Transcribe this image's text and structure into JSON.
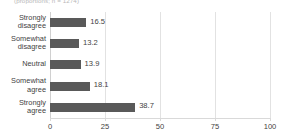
{
  "caption": "(proportions; n = 1274)",
  "colors": {
    "bar": "#595959",
    "grid": "#e2e2e2",
    "axis": "#d9d9d9",
    "text": "#3f3f3f",
    "caption": "#b8b8b8",
    "background": "#ffffff"
  },
  "chart_data": {
    "type": "bar",
    "orientation": "horizontal",
    "title": "",
    "subtitle": "(proportions; n = 1274)",
    "xlabel": "",
    "ylabel": "",
    "categories": [
      "Strongly\ndisagree",
      "Somewhat\ndisagree",
      "Neutral",
      "Somewhat\nagree",
      "Strongly\nagree"
    ],
    "values": [
      16.5,
      13.2,
      13.9,
      18.1,
      38.7
    ],
    "value_labels": [
      "16.5",
      "13.2",
      "13.9",
      "18.1",
      "38.7"
    ],
    "xlim": [
      0,
      100
    ],
    "xticks": [
      0,
      25,
      50,
      75,
      100
    ],
    "xtick_labels": [
      "0",
      "25",
      "50",
      "75",
      "100"
    ],
    "grid": true,
    "grid_axis": "x",
    "legend": false,
    "series": [
      {
        "name": "Response share",
        "values": [
          16.5,
          13.2,
          13.9,
          18.1,
          38.7
        ]
      }
    ]
  }
}
